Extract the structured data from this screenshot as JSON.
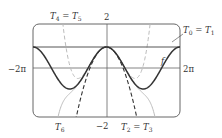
{
  "chart_data": {
    "type": "line",
    "title": "",
    "xlabel": "",
    "ylabel": "",
    "xlim": [
      -6.2832,
      6.2832
    ],
    "ylim": [
      -2,
      2
    ],
    "x_tick_labels": [
      "-2π",
      "2π"
    ],
    "y_tick_labels": [
      "2",
      "-2"
    ],
    "grid": false,
    "series": [
      {
        "name": "f",
        "expression": "cos(x)",
        "style": "solid",
        "color": "#333333"
      },
      {
        "name": "T0 = T1",
        "expression": "1",
        "style": "solid",
        "color": "#555555"
      },
      {
        "name": "T2 = T3",
        "expression": "1 - x^2/2",
        "style": "dashed",
        "color": "#333333"
      },
      {
        "name": "T4 = T5",
        "expression": "1 - x^2/2 + x^4/24",
        "style": "dashed",
        "color": "#bbbbbb"
      },
      {
        "name": "T6",
        "expression": "1 - x^2/2 + x^4/24 - x^6/720",
        "style": "solid",
        "color": "#bbbbbb"
      }
    ]
  },
  "labels": {
    "y_top": "2",
    "y_bottom": "−2",
    "x_left": "−2π",
    "x_right": "2π",
    "f": "f",
    "t0_t1": {
      "a": "T",
      "a_sub": "0",
      "eq": " = ",
      "b": "T",
      "b_sub": "1"
    },
    "t2_t3": {
      "a": "T",
      "a_sub": "2",
      "eq": " = ",
      "b": "T",
      "b_sub": "3"
    },
    "t4_t5": {
      "a": "T",
      "a_sub": "4",
      "eq": " = ",
      "b": "T",
      "b_sub": "5"
    },
    "t6": {
      "a": "T",
      "a_sub": "6"
    }
  }
}
